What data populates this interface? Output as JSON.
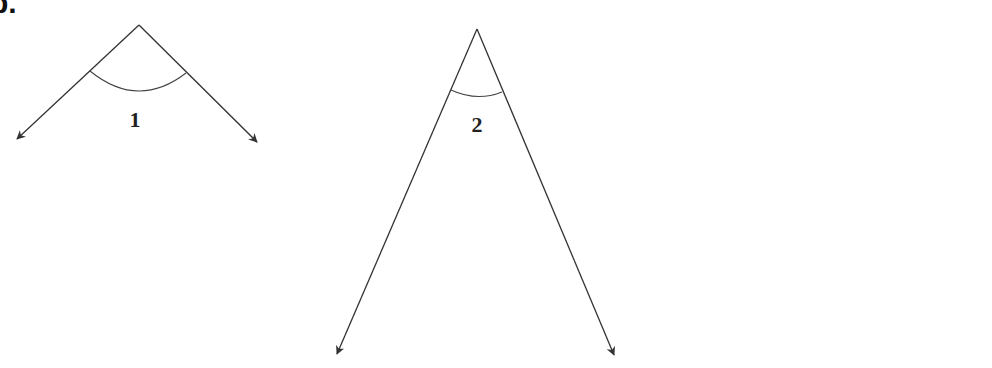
{
  "problem": {
    "label": "b."
  },
  "colors": {
    "stroke": "#333333",
    "label": "#222222",
    "background": "#ffffff"
  },
  "angles": [
    {
      "id": "1",
      "label": "1",
      "vertex": [
        139,
        25
      ],
      "ray_left_tip": [
        17,
        139
      ],
      "ray_right_tip": [
        257,
        142
      ],
      "arc": {
        "start": [
          90,
          71
        ],
        "end": [
          186,
          73
        ],
        "control": [
          138,
          110
        ]
      },
      "label_pos": [
        135,
        127
      ]
    },
    {
      "id": "2",
      "label": "2",
      "vertex": [
        477,
        29
      ],
      "ray_left_tip": [
        337,
        354
      ],
      "ray_right_tip": [
        614,
        355
      ],
      "arc": {
        "start": [
          451,
          90
        ],
        "end": [
          502,
          92
        ],
        "control": [
          477,
          102
        ]
      },
      "label_pos": [
        477,
        132
      ]
    }
  ]
}
